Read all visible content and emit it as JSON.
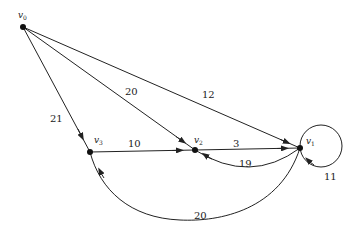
{
  "diagram": {
    "type": "directed weighted graph",
    "nodes": [
      {
        "id": "v0",
        "label": "v",
        "sub": "0",
        "x": 23,
        "y": 27,
        "lx": 18,
        "ly": 18
      },
      {
        "id": "v1",
        "label": "v",
        "sub": "1",
        "x": 300,
        "y": 148,
        "lx": 306,
        "ly": 144
      },
      {
        "id": "v2",
        "label": "v",
        "sub": "2",
        "x": 195,
        "y": 150,
        "lx": 194,
        "ly": 143
      },
      {
        "id": "v3",
        "label": "v",
        "sub": "3",
        "x": 90,
        "y": 152,
        "lx": 94,
        "ly": 143
      }
    ],
    "edges": [
      {
        "from": "v0",
        "to": "v3",
        "weight": "21",
        "lx": 50,
        "ly": 122
      },
      {
        "from": "v0",
        "to": "v2",
        "weight": "20",
        "lx": 125,
        "ly": 95
      },
      {
        "from": "v0",
        "to": "v1",
        "weight": "12",
        "lx": 202,
        "ly": 98
      },
      {
        "from": "v3",
        "to": "v2",
        "weight": "10",
        "lx": 128,
        "ly": 147
      },
      {
        "from": "v2",
        "to": "v1",
        "weight": "3",
        "lx": 233,
        "ly": 147
      },
      {
        "from": "v1",
        "to": "v2",
        "weight": "19",
        "lx": 239,
        "ly": 167
      },
      {
        "from": "v1",
        "to": "v1",
        "weight": "11",
        "lx": 324,
        "ly": 180
      },
      {
        "from": "v1",
        "to": "v3",
        "weight": "20",
        "lx": 194,
        "ly": 219
      }
    ]
  }
}
